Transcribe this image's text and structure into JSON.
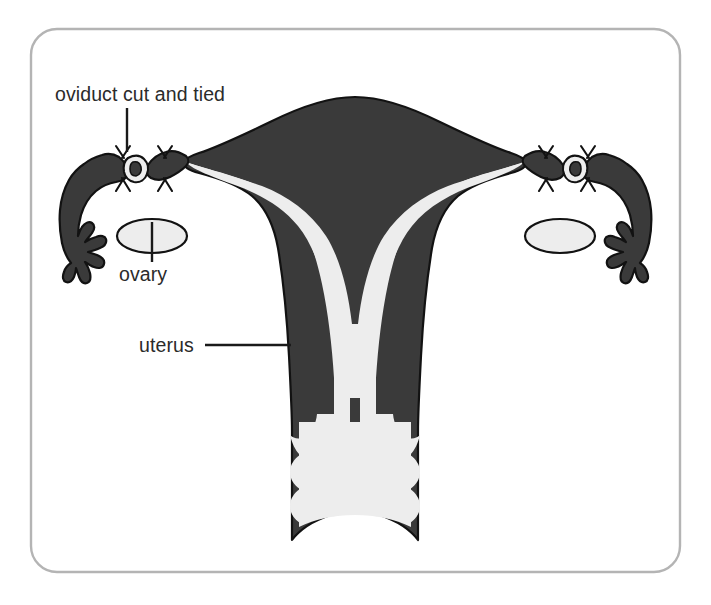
{
  "figure": {
    "frame": {
      "x": 31,
      "y": 29,
      "width": 649,
      "height": 543,
      "corner_radius": 26,
      "stroke_color": "#b4b4b4"
    },
    "colors": {
      "organ_dark": "#3a3a3a",
      "organ_outline": "#121212",
      "cavity_light": "#ededed",
      "background": "#ffffff",
      "label_text": "#2b2b2b",
      "leader_line": "#1a1a1a",
      "frame": "#b4b4b4"
    }
  },
  "labels": [
    {
      "id": "oviduct",
      "text": "oviduct cut and tied",
      "text_x": 55,
      "text_y": 101,
      "anchor": "start",
      "leader": {
        "x1": 127,
        "y1": 108,
        "x2": 127,
        "y2": 152
      },
      "leader_orientation": "vertical"
    },
    {
      "id": "ovary",
      "text": "ovary",
      "text_x": 119,
      "text_y": 281,
      "anchor": "start",
      "leader": {
        "x1": 152,
        "y1": 222,
        "x2": 152,
        "y2": 262
      },
      "leader_orientation": "vertical"
    },
    {
      "id": "uterus",
      "text": "uterus",
      "text_x": 139,
      "text_y": 352,
      "anchor": "start",
      "leader": {
        "x1": 205,
        "y1": 345,
        "x2": 291,
        "y2": 345
      },
      "leader_orientation": "horizontal"
    }
  ],
  "anatomy": {
    "uterus": {
      "name": "uterus",
      "description": "Central muscular organ, dark gray myometrium with light endometrial cavity, broad fundus tapering to cervix",
      "fill": "#3a3a3a",
      "cavity_fill": "#ededed"
    },
    "cervix_vagina": {
      "name": "cervix and vagina",
      "description": "Lower canal with wavy rugae walls and concave inferior margin",
      "fill": "#3a3a3a",
      "lumen_fill": "#ededed"
    },
    "oviducts": [
      {
        "side": "left",
        "name": "oviduct (fallopian tube)",
        "state": "cut and tied",
        "ligature_count": 2,
        "fimbriae_count": 6
      },
      {
        "side": "right",
        "name": "oviduct (fallopian tube)",
        "state": "cut and tied",
        "ligature_count": 2,
        "fimbriae_count": 6
      }
    ],
    "ovaries": [
      {
        "side": "left",
        "name": "ovary",
        "cx": 152,
        "cy": 236,
        "rx": 35,
        "ry": 17,
        "fill": "#ededed"
      },
      {
        "side": "right",
        "name": "ovary",
        "cx": 560,
        "cy": 236,
        "rx": 35,
        "ry": 17,
        "fill": "#ededed"
      }
    ]
  }
}
